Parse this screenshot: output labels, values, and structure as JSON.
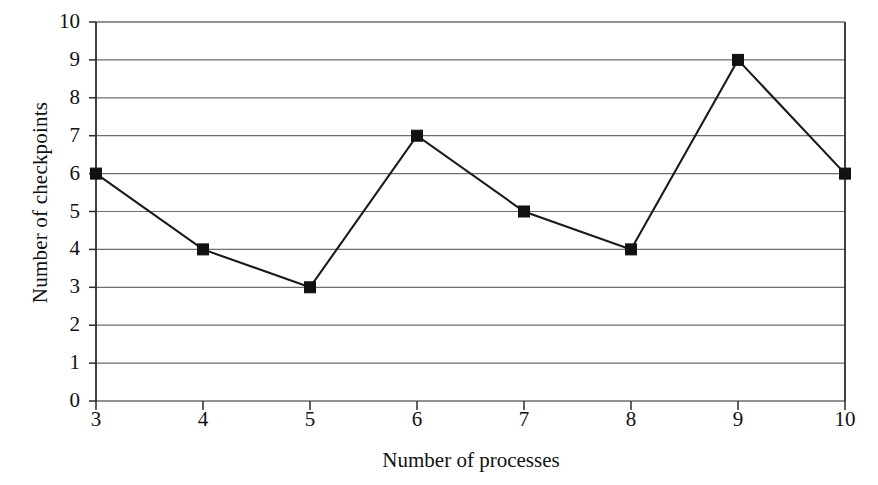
{
  "chart_data": {
    "type": "line",
    "title": "",
    "xlabel": "Number of processes",
    "ylabel": "Number of checkpoints",
    "x": [
      3,
      4,
      5,
      6,
      7,
      8,
      9,
      10
    ],
    "values": [
      6,
      4,
      3,
      7,
      5,
      4,
      9,
      6
    ],
    "series": [
      {
        "name": "Number of checkpoints",
        "values": [
          6,
          4,
          3,
          7,
          5,
          4,
          9,
          6
        ]
      }
    ],
    "xlim": [
      3,
      10
    ],
    "ylim": [
      0,
      10
    ],
    "xticks": [
      "3",
      "4",
      "5",
      "6",
      "7",
      "8",
      "9",
      "10"
    ],
    "yticks": [
      "0",
      "1",
      "2",
      "3",
      "4",
      "5",
      "6",
      "7",
      "8",
      "9",
      "10"
    ],
    "grid": "horizontal",
    "legend": "none",
    "marker": "filled-square",
    "line_color": "#1a1a1a",
    "marker_color": "#111111",
    "grid_color": "#6e6e6e",
    "axis_color": "#2b2b2b",
    "background": "#ffffff"
  }
}
